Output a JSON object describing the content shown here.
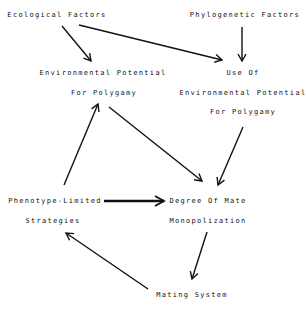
{
  "diagram": {
    "nodes": {
      "ecological_factors": {
        "lines": [
          "Ecological Factors"
        ]
      },
      "phylogenetic_factors": {
        "lines": [
          "Phylogenetic Factors"
        ]
      },
      "environmental_potential": {
        "lines": [
          "Environmental Potential",
          "For Polygamy"
        ]
      },
      "use_of_environmental_potential": {
        "lines": [
          "Use Of",
          "Environmental Potential",
          "For Polygamy"
        ]
      },
      "phenotype_limited_strategies": {
        "lines": [
          "Phenotype-Limited",
          "Strategies"
        ]
      },
      "degree_of_mate_monopolization": {
        "lines": [
          "Degree Of Mate",
          "Monopolization"
        ]
      },
      "mating_system": {
        "lines": [
          "Mating System"
        ]
      }
    },
    "edges": [
      {
        "from": "Ecological Factors",
        "to": "Environmental Potential For Polygamy"
      },
      {
        "from": "Ecological Factors",
        "to": "Use Of Environmental Potential For Polygamy"
      },
      {
        "from": "Phylogenetic Factors",
        "to": "Use Of Environmental Potential For Polygamy"
      },
      {
        "from": "Phenotype-Limited Strategies",
        "to": "Environmental Potential For Polygamy"
      },
      {
        "from": "Environmental Potential For Polygamy",
        "to": "Degree Of Mate Monopolization"
      },
      {
        "from": "Use Of Environmental Potential For Polygamy",
        "to": "Degree Of Mate Monopolization"
      },
      {
        "from": "Phenotype-Limited Strategies",
        "to": "Degree Of Mate Monopolization",
        "style": "thick"
      },
      {
        "from": "Degree Of Mate Monopolization",
        "to": "Mating System"
      },
      {
        "from": "Mating System",
        "to": "Phenotype-Limited Strategies"
      }
    ],
    "colors": {
      "ink": "#111111",
      "background": "#ffffff"
    }
  }
}
